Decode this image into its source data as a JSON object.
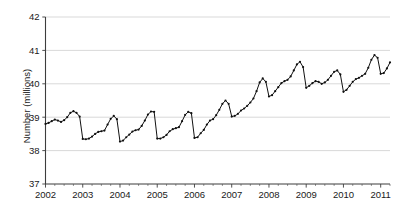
{
  "chart_data": {
    "type": "line",
    "title": "",
    "subtitle": "",
    "xlabel": "",
    "ylabel": "Number (millions)",
    "ylim": [
      37,
      42
    ],
    "xlim": [
      2002.0,
      2011.25
    ],
    "grid": true,
    "legend": null,
    "markers": true,
    "line_color": "#111111",
    "grid_color": "#c9c9c9",
    "axis_color": "#3d3d3d",
    "ytick_labels": [
      "37",
      "38",
      "39",
      "40",
      "41",
      "42"
    ],
    "ytick_values": [
      37,
      38,
      39,
      40,
      41,
      42
    ],
    "xtick_labels": [
      "2002",
      "2003",
      "2004",
      "2005",
      "2006",
      "2007",
      "2008",
      "2009",
      "2010",
      "2011"
    ],
    "xtick_values": [
      2002,
      2003,
      2004,
      2005,
      2006,
      2007,
      2008,
      2009,
      2010,
      2011
    ],
    "x_minor_ticks_per_year": 4,
    "x": [
      2002.0,
      2002.083,
      2002.167,
      2002.25,
      2002.333,
      2002.417,
      2002.5,
      2002.583,
      2002.667,
      2002.75,
      2002.833,
      2002.917,
      2003.0,
      2003.083,
      2003.167,
      2003.25,
      2003.333,
      2003.417,
      2003.5,
      2003.583,
      2003.667,
      2003.75,
      2003.833,
      2003.917,
      2004.0,
      2004.083,
      2004.167,
      2004.25,
      2004.333,
      2004.417,
      2004.5,
      2004.583,
      2004.667,
      2004.75,
      2004.833,
      2004.917,
      2005.0,
      2005.083,
      2005.167,
      2005.25,
      2005.333,
      2005.417,
      2005.5,
      2005.583,
      2005.667,
      2005.75,
      2005.833,
      2005.917,
      2006.0,
      2006.083,
      2006.167,
      2006.25,
      2006.333,
      2006.417,
      2006.5,
      2006.583,
      2006.667,
      2006.75,
      2006.833,
      2006.917,
      2007.0,
      2007.083,
      2007.167,
      2007.25,
      2007.333,
      2007.417,
      2007.5,
      2007.583,
      2007.667,
      2007.75,
      2007.833,
      2007.917,
      2008.0,
      2008.083,
      2008.167,
      2008.25,
      2008.333,
      2008.417,
      2008.5,
      2008.583,
      2008.667,
      2008.75,
      2008.833,
      2008.917,
      2009.0,
      2009.083,
      2009.167,
      2009.25,
      2009.333,
      2009.417,
      2009.5,
      2009.583,
      2009.667,
      2009.75,
      2009.833,
      2009.917,
      2010.0,
      2010.083,
      2010.167,
      2010.25,
      2010.333,
      2010.417,
      2010.5,
      2010.583,
      2010.667,
      2010.75,
      2010.833,
      2010.917,
      2011.0,
      2011.083,
      2011.167,
      2011.25
    ],
    "values": [
      38.8,
      38.83,
      38.88,
      38.93,
      38.9,
      38.86,
      38.91,
      39.0,
      39.13,
      39.18,
      39.13,
      39.02,
      38.35,
      38.34,
      38.36,
      38.42,
      38.5,
      38.56,
      38.58,
      38.6,
      38.78,
      38.95,
      39.04,
      38.94,
      38.27,
      38.3,
      38.4,
      38.48,
      38.57,
      38.61,
      38.63,
      38.74,
      38.9,
      39.08,
      39.17,
      39.16,
      38.36,
      38.36,
      38.4,
      38.47,
      38.58,
      38.64,
      38.67,
      38.7,
      38.88,
      39.07,
      39.16,
      39.12,
      38.38,
      38.4,
      38.52,
      38.62,
      38.78,
      38.9,
      38.94,
      39.06,
      39.22,
      39.4,
      39.5,
      39.4,
      39.02,
      39.04,
      39.1,
      39.2,
      39.26,
      39.34,
      39.44,
      39.56,
      39.78,
      40.04,
      40.16,
      40.06,
      39.62,
      39.66,
      39.78,
      39.9,
      40.02,
      40.08,
      40.12,
      40.22,
      40.4,
      40.58,
      40.66,
      40.5,
      39.88,
      39.94,
      40.02,
      40.08,
      40.06,
      40.0,
      40.04,
      40.12,
      40.24,
      40.36,
      40.4,
      40.28,
      39.76,
      39.82,
      39.94,
      40.06,
      40.14,
      40.18,
      40.24,
      40.3,
      40.48,
      40.72,
      40.86,
      40.78,
      40.3,
      40.32,
      40.46,
      40.64
    ]
  }
}
